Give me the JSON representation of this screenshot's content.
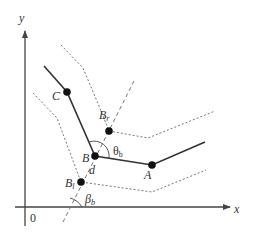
{
  "diagram": {
    "colors": {
      "line": "#333333",
      "dashed": "#777777",
      "point": "#111111",
      "background": "#ffffff"
    },
    "axes": {
      "x_label": "x",
      "y_label": "y",
      "origin_label": "0"
    },
    "points": {
      "A": {
        "label": "A",
        "sub": ""
      },
      "B": {
        "label": "B",
        "sub": ""
      },
      "C": {
        "label": "C",
        "sub": ""
      },
      "Br": {
        "label": "B",
        "sub": "r"
      },
      "Bl": {
        "label": "B",
        "sub": "l"
      }
    },
    "annotations": {
      "distance": "d",
      "theta": "θ",
      "theta_sub": "b",
      "beta": "β",
      "beta_sub": "b"
    },
    "geometry": {
      "centerline": [
        [
          44,
          66
        ],
        [
          67,
          92
        ],
        [
          95,
          156
        ],
        [
          152,
          165
        ],
        [
          205,
          142
        ]
      ],
      "offset_upper": [
        [
          61,
          45
        ],
        [
          83,
          68
        ],
        [
          99,
          106
        ],
        [
          109,
          131
        ],
        [
          148,
          138
        ],
        [
          215,
          111
        ]
      ],
      "offset_lower": [
        [
          33,
          93
        ],
        [
          57,
          118
        ],
        [
          81,
          182
        ],
        [
          152,
          192
        ],
        [
          206,
          170
        ]
      ],
      "bisector": [
        [
          134,
          81
        ],
        [
          63,
          222
        ]
      ],
      "nodes": {
        "C": [
          67,
          92
        ],
        "B": [
          95,
          156
        ],
        "A": [
          152,
          165
        ],
        "Br": [
          109,
          131
        ],
        "Bl": [
          81,
          182
        ]
      }
    }
  }
}
